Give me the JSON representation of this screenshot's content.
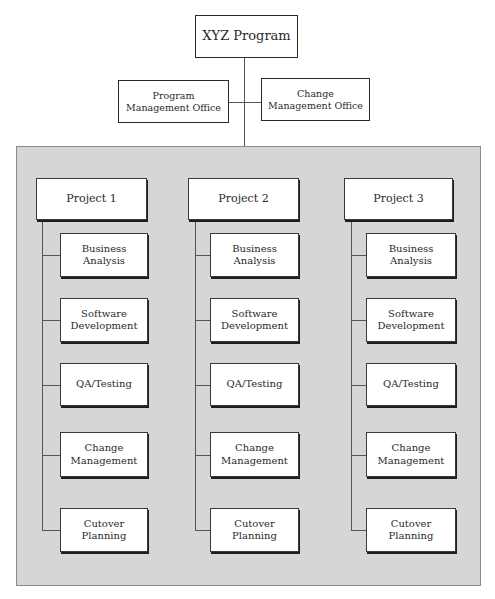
{
  "program": {
    "title": "XYZ Program",
    "offices": [
      {
        "label": "Program Management Office"
      },
      {
        "label": "Change Management Office"
      }
    ]
  },
  "projects": [
    {
      "label": "Project 1",
      "functions": [
        "Business Analysis",
        "Software Development",
        "QA/Testing",
        "Change Management",
        "Cutover Planning"
      ]
    },
    {
      "label": "Project 2",
      "functions": [
        "Business Analysis",
        "Software Development",
        "QA/Testing",
        "Change Management",
        "Cutover Planning"
      ]
    },
    {
      "label": "Project 3",
      "functions": [
        "Business Analysis",
        "Software Development",
        "QA/Testing",
        "Change Management",
        "Cutover Planning"
      ]
    }
  ],
  "colors": {
    "panel_background": "#d6d6d6",
    "box_background": "#ffffff",
    "line": "#555555"
  }
}
